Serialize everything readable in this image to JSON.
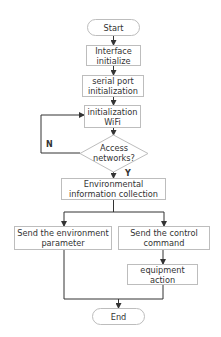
{
  "diagram": {
    "type": "flowchart",
    "nodes": {
      "start": {
        "label": "Start",
        "shape": "terminator"
      },
      "interface": {
        "label": "Interface initialize",
        "shape": "process"
      },
      "serial": {
        "label": "serial port initialization",
        "shape": "process"
      },
      "wifi": {
        "label": "initialization WiFi",
        "shape": "process"
      },
      "access": {
        "label": "Access networks?",
        "shape": "decision"
      },
      "env": {
        "label": "Environmental information collection",
        "shape": "process"
      },
      "send_env": {
        "label": "Send the environment parameter",
        "shape": "process"
      },
      "send_ctrl": {
        "label": "Send the control command",
        "shape": "process"
      },
      "equip": {
        "label": "equipment action",
        "shape": "process"
      },
      "end": {
        "label": "End",
        "shape": "terminator"
      }
    },
    "edge_labels": {
      "no": "N",
      "yes": "Y"
    },
    "edges": [
      {
        "from": "start",
        "to": "interface"
      },
      {
        "from": "interface",
        "to": "serial"
      },
      {
        "from": "serial",
        "to": "wifi"
      },
      {
        "from": "wifi",
        "to": "access"
      },
      {
        "from": "access",
        "to": "wifi",
        "label": "N"
      },
      {
        "from": "access",
        "to": "env",
        "label": "Y"
      },
      {
        "from": "env",
        "to": "send_env"
      },
      {
        "from": "env",
        "to": "send_ctrl"
      },
      {
        "from": "send_ctrl",
        "to": "equip"
      },
      {
        "from": "send_env",
        "to": "end"
      },
      {
        "from": "equip",
        "to": "end"
      }
    ],
    "colors": {
      "line": "#333333",
      "border": "#bdbdbd",
      "text": "#333333"
    }
  }
}
